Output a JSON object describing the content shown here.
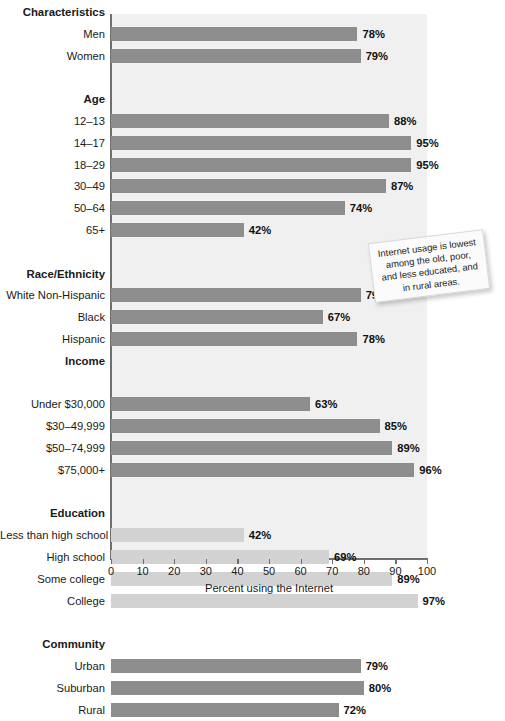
{
  "chart_data": {
    "type": "bar",
    "title": "",
    "xlabel": "Percent using the Internet",
    "ylabel": "",
    "xlim": [
      0,
      100
    ],
    "orientation": "horizontal",
    "grid": false,
    "legend": false,
    "xticks": [
      "0",
      "10",
      "20",
      "30",
      "40",
      "50",
      "60",
      "70",
      "80",
      "90",
      "100"
    ],
    "xtick_values": [
      0,
      10,
      20,
      30,
      40,
      50,
      60,
      70,
      80,
      90,
      100
    ],
    "categories": [
      "Men",
      "Women",
      "12–13",
      "14–17",
      "18–29",
      "30–49",
      "50–64",
      "65+",
      "White Non-Hispanic",
      "Black",
      "Hispanic",
      "Under $30,000",
      "$30–49,999",
      "$50–74,999",
      "$75,000+",
      "Less than high school",
      "High school",
      "Some college",
      "College",
      "Urban",
      "Suburban",
      "Rural"
    ],
    "values": [
      78,
      79,
      88,
      95,
      95,
      87,
      74,
      42,
      79,
      67,
      78,
      63,
      85,
      89,
      96,
      42,
      69,
      89,
      97,
      79,
      80,
      72
    ],
    "value_labels": [
      "78%",
      "79%",
      "88%",
      "95%",
      "95%",
      "87%",
      "74%",
      "42%",
      "79%",
      "67%",
      "78%",
      "63%",
      "85%",
      "89%",
      "96%",
      "42%",
      "69%",
      "89%",
      "97%",
      "79%",
      "80%",
      "72%"
    ],
    "group_headers": [
      "Characteristics",
      "Age",
      "Race/Ethnicity",
      "Income",
      "Education",
      "Community"
    ],
    "colors": {
      "bar_dark": "#8d8d8d",
      "bar_light": "#d2d2d2",
      "plot_background": "#f0f0f0",
      "axis": "#6f6f6f"
    }
  },
  "rows": [
    {
      "kind": "header",
      "label": "Characteristics"
    },
    {
      "kind": "bar",
      "label": "Men",
      "value": 78,
      "value_label": "78%",
      "shade": "dark"
    },
    {
      "kind": "bar",
      "label": "Women",
      "value": 79,
      "value_label": "79%",
      "shade": "dark"
    },
    {
      "kind": "spacer",
      "label": ""
    },
    {
      "kind": "header",
      "label": "Age"
    },
    {
      "kind": "bar",
      "label": "12–13",
      "value": 88,
      "value_label": "88%",
      "shade": "dark"
    },
    {
      "kind": "bar",
      "label": "14–17",
      "value": 95,
      "value_label": "95%",
      "shade": "dark"
    },
    {
      "kind": "bar",
      "label": "18–29",
      "value": 95,
      "value_label": "95%",
      "shade": "dark"
    },
    {
      "kind": "bar",
      "label": "30–49",
      "value": 87,
      "value_label": "87%",
      "shade": "dark"
    },
    {
      "kind": "bar",
      "label": "50–64",
      "value": 74,
      "value_label": "74%",
      "shade": "dark"
    },
    {
      "kind": "bar",
      "label": "65+",
      "value": 42,
      "value_label": "42%",
      "shade": "dark"
    },
    {
      "kind": "spacer",
      "label": ""
    },
    {
      "kind": "header",
      "label": "Race/Ethnicity"
    },
    {
      "kind": "bar",
      "label": "White Non-Hispanic",
      "value": 79,
      "value_label": "79%",
      "shade": "dark"
    },
    {
      "kind": "bar",
      "label": "Black",
      "value": 67,
      "value_label": "67%",
      "shade": "dark"
    },
    {
      "kind": "bar",
      "label": "Hispanic",
      "value": 78,
      "value_label": "78%",
      "shade": "dark"
    },
    {
      "kind": "header",
      "label": "Income"
    },
    {
      "kind": "spacer",
      "label": ""
    },
    {
      "kind": "bar",
      "label": "Under $30,000",
      "value": 63,
      "value_label": "63%",
      "shade": "dark"
    },
    {
      "kind": "bar",
      "label": "$30–49,999",
      "value": 85,
      "value_label": "85%",
      "shade": "dark"
    },
    {
      "kind": "bar",
      "label": "$50–74,999",
      "value": 89,
      "value_label": "89%",
      "shade": "dark"
    },
    {
      "kind": "bar",
      "label": "$75,000+",
      "value": 96,
      "value_label": "96%",
      "shade": "dark"
    },
    {
      "kind": "spacer",
      "label": ""
    },
    {
      "kind": "header",
      "label": "Education"
    },
    {
      "kind": "bar",
      "label": "Less than high school",
      "value": 42,
      "value_label": "42%",
      "shade": "light"
    },
    {
      "kind": "bar",
      "label": "High school",
      "value": 69,
      "value_label": "69%",
      "shade": "light"
    },
    {
      "kind": "bar",
      "label": "Some college",
      "value": 89,
      "value_label": "89%",
      "shade": "light"
    },
    {
      "kind": "bar",
      "label": "College",
      "value": 97,
      "value_label": "97%",
      "shade": "light"
    },
    {
      "kind": "spacer",
      "label": ""
    },
    {
      "kind": "header",
      "label": "Community"
    },
    {
      "kind": "bar",
      "label": "Urban",
      "value": 79,
      "value_label": "79%",
      "shade": "dark"
    },
    {
      "kind": "bar",
      "label": "Suburban",
      "value": 80,
      "value_label": "80%",
      "shade": "dark"
    },
    {
      "kind": "bar",
      "label": "Rural",
      "value": 72,
      "value_label": "72%",
      "shade": "dark"
    }
  ],
  "callout": {
    "text": "Internet usage is lowest among the old, poor, and less educated, and in rural areas."
  },
  "axis": {
    "x_title": "Percent using the Internet"
  }
}
